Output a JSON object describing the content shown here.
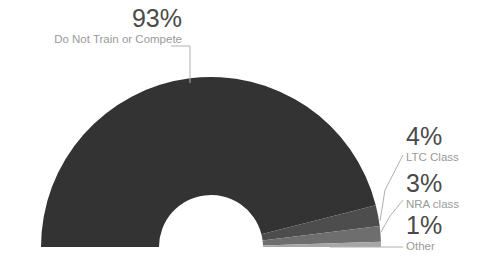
{
  "chart_data": {
    "type": "pie",
    "variant": "half-donut",
    "title": "",
    "subtitle": "",
    "xlabel": "",
    "ylabel": "",
    "legend": "none",
    "grid": false,
    "total": 101,
    "units": "%",
    "categories": [
      "Do Not Train or Compete",
      "LTC Class",
      "NRA class",
      "Other"
    ],
    "values": [
      93,
      4,
      3,
      1
    ],
    "value_labels": [
      "93%",
      "4%",
      "3%",
      "1%"
    ],
    "colors": [
      "#333333",
      "#4d4d4d",
      "#6e6e6e",
      "#a6a6a6"
    ],
    "geometry": {
      "center_x": 211,
      "center_y": 247,
      "outer_radius": 170,
      "inner_radius": 52,
      "start_angle_deg": 180,
      "sweep_deg": 180,
      "direction": "clockwise"
    },
    "slices": [
      {
        "name": "Do Not Train or Compete",
        "value": 93,
        "value_label": "93%",
        "color": "#333333"
      },
      {
        "name": "LTC Class",
        "value": 4,
        "value_label": "4%",
        "color": "#4d4d4d"
      },
      {
        "name": "NRA class",
        "value": 3,
        "value_label": "3%",
        "color": "#6e6e6e"
      },
      {
        "name": "Other",
        "value": 1,
        "value_label": "1%",
        "color": "#a6a6a6"
      }
    ]
  },
  "labels": {
    "main": {
      "pct": "93%",
      "name": "Do Not Train or Compete"
    },
    "ltc": {
      "pct": "4%",
      "name": "LTC Class"
    },
    "nra": {
      "pct": "3%",
      "name": "NRA class"
    },
    "other": {
      "pct": "1%",
      "name": "Other"
    }
  },
  "style": {
    "background": "#ffffff",
    "leader_line_color": "#b0b0b0",
    "pct_text_color": "#4a4a4a",
    "sub_text_color": "#9a9a9a"
  }
}
